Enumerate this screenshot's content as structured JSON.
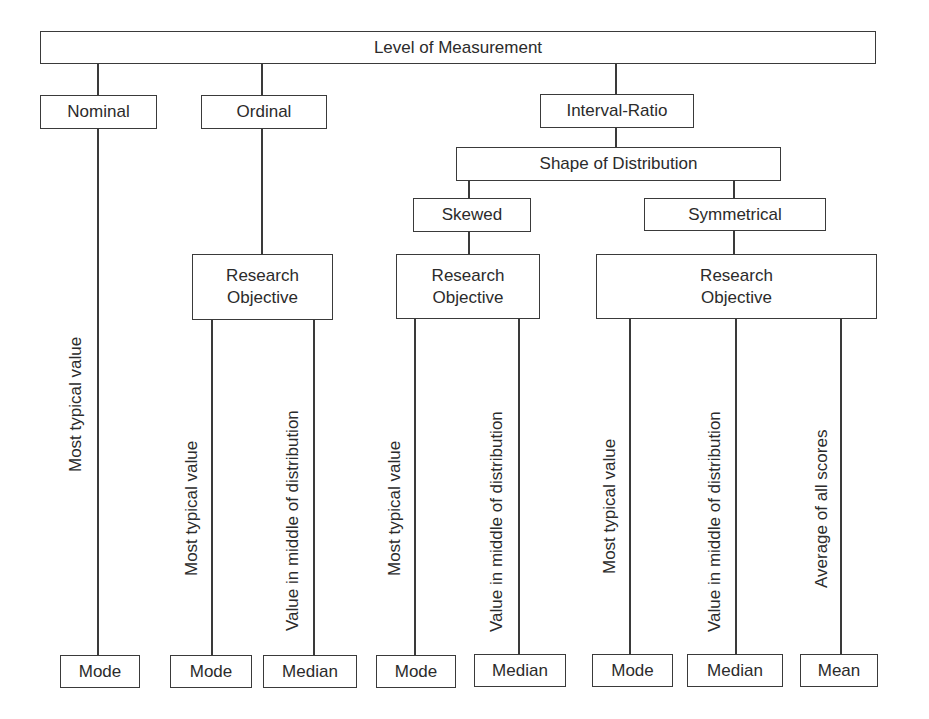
{
  "diagram": {
    "root": "Level of Measurement",
    "levels": {
      "nominal": "Nominal",
      "ordinal": "Ordinal",
      "interval_ratio": "Interval-Ratio"
    },
    "shape_of_distribution": "Shape of Distribution",
    "shapes": {
      "skewed": "Skewed",
      "symmetrical": "Symmetrical"
    },
    "research_objective": {
      "line1": "Research",
      "line2": "Objective"
    },
    "objectives": {
      "most_typical": "Most typical  value",
      "middle": "Value in middle of distribution",
      "average": "Average of all scores"
    },
    "measures": {
      "nominal_mode": "Mode",
      "ordinal_mode": "Mode",
      "ordinal_median": "Median",
      "skewed_mode": "Mode",
      "skewed_median": "Median",
      "symmetrical_mode": "Mode",
      "symmetrical_median": "Median",
      "symmetrical_mean": "Mean"
    }
  }
}
